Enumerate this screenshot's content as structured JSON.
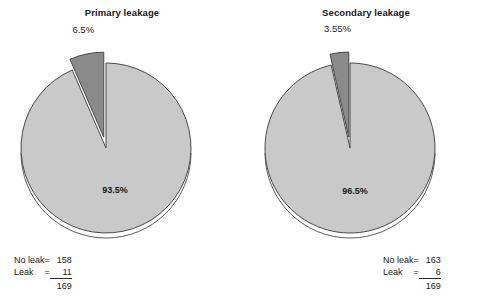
{
  "chart_data": [
    {
      "type": "pie",
      "title": "Primary leakage",
      "categories": [
        "No leak",
        "Leak"
      ],
      "values": [
        158,
        11
      ],
      "percent_labels": [
        "93.5%",
        "6.5%"
      ],
      "total": 169,
      "exploded_index": 1,
      "colors": [
        "#c9c9c9",
        "#8a8a8a"
      ],
      "legend": {
        "rows": [
          {
            "label": "No leak",
            "eq": "=",
            "value": "158"
          },
          {
            "label": "Leak",
            "eq": "=",
            "value": "11"
          }
        ],
        "total": "169"
      }
    },
    {
      "type": "pie",
      "title": "Secondary leakage",
      "categories": [
        "No leak",
        "Leak"
      ],
      "values": [
        163,
        6
      ],
      "percent_labels": [
        "96.5%",
        "3.55%"
      ],
      "total": 169,
      "exploded_index": 1,
      "colors": [
        "#c9c9c9",
        "#8a8a8a"
      ],
      "legend": {
        "rows": [
          {
            "label": "No leak",
            "eq": "=",
            "value": "163"
          },
          {
            "label": "Leak",
            "eq": "=",
            "value": "6"
          }
        ],
        "total": "169"
      }
    }
  ],
  "figure": {
    "background": "#ffffff",
    "outline_color": "#4a4a4a",
    "text_color": "#1a1a1a"
  }
}
